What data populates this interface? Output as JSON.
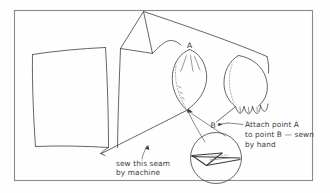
{
  "figure": {
    "background_color": "#fefefe",
    "frame_color": "#8a8a8a",
    "ink_color": "#4a4a4a"
  },
  "labels": {
    "point_a": "A",
    "point_b": "B"
  },
  "annotations": {
    "machine_seam": {
      "line1": "sew this seam",
      "line2": "by machine"
    },
    "hand_seam": {
      "line1": "Attach point A",
      "line2": "to point B — sewn",
      "line3": "by hand"
    }
  },
  "parts": {
    "cuff_panel": "cuff-panel",
    "thumb_piece": "thumb-piece",
    "fingers_piece": "fingers-piece",
    "detail_circle": "detail-magnifier"
  }
}
